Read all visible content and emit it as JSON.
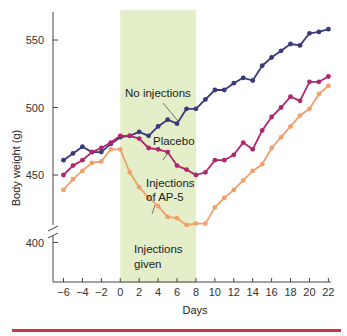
{
  "chart_data": {
    "type": "line",
    "title": "",
    "xlabel": "Days",
    "ylabel": "Body weight (g)",
    "xlim": [
      -6,
      22
    ],
    "ylim": [
      380,
      570
    ],
    "y_axis_break": true,
    "grid": false,
    "legend": "inline annotations",
    "x_ticks": [
      -6,
      -4,
      -2,
      0,
      2,
      4,
      6,
      8,
      10,
      12,
      14,
      16,
      18,
      20,
      22
    ],
    "x_tick_labels": [
      "−6",
      "−4",
      "−2",
      "0",
      "2",
      "4",
      "6",
      "8",
      "10",
      "12",
      "14",
      "16",
      "18",
      "20",
      "22"
    ],
    "y_ticks": [
      400,
      450,
      500,
      550
    ],
    "y_tick_labels": [
      "400",
      "450",
      "500",
      "550"
    ],
    "x": [
      -6,
      -5,
      -4,
      -3,
      -2,
      -1,
      0,
      1,
      2,
      3,
      4,
      5,
      6,
      7,
      8,
      9,
      10,
      11,
      12,
      13,
      14,
      15,
      16,
      17,
      18,
      19,
      20,
      21,
      22
    ],
    "shaded_region": {
      "x_start": 0,
      "x_end": 8,
      "label": "Injections given",
      "color": "#e4eec9"
    },
    "series": [
      {
        "name": "No injections",
        "color": "#3a3a7a",
        "values": [
          461,
          466,
          471,
          467,
          467,
          473,
          478,
          479,
          482,
          479,
          486,
          491,
          488,
          499,
          499,
          506,
          513,
          513,
          518,
          522,
          520,
          531,
          537,
          542,
          547,
          546,
          555,
          556,
          558
        ]
      },
      {
        "name": "Placebo",
        "color": "#b0266e",
        "values": [
          450,
          457,
          461,
          467,
          470,
          474,
          479,
          479,
          477,
          470,
          469,
          467,
          457,
          454,
          450,
          452,
          461,
          461,
          465,
          474,
          469,
          483,
          493,
          500,
          508,
          505,
          519,
          519,
          523
        ]
      },
      {
        "name": "Injections of AP-5",
        "color": "#f0a06a",
        "values": [
          439,
          447,
          453,
          459,
          460,
          469,
          469,
          452,
          441,
          433,
          427,
          419,
          418,
          413,
          414,
          414,
          426,
          433,
          439,
          446,
          453,
          458,
          470,
          478,
          486,
          494,
          499,
          510,
          516
        ]
      }
    ],
    "annotations": [
      {
        "text_lines": [
          "No injections"
        ],
        "series": "No injections"
      },
      {
        "text_lines": [
          "Placebo"
        ],
        "series": "Placebo"
      },
      {
        "text_lines": [
          "Injections",
          "of AP-5"
        ],
        "series": "Injections of AP-5"
      },
      {
        "text_lines": [
          "Injections",
          "given"
        ],
        "series": null
      }
    ]
  },
  "labels": {
    "xlabel": "Days",
    "ylabel": "Body weight (g)",
    "annot_no_inj": "No injections",
    "annot_placebo": "Placebo",
    "annot_ap5_1": "Injections",
    "annot_ap5_2": "of AP-5",
    "annot_given_1": "Injections",
    "annot_given_2": "given"
  },
  "footer_rule_color": "#d0344a"
}
